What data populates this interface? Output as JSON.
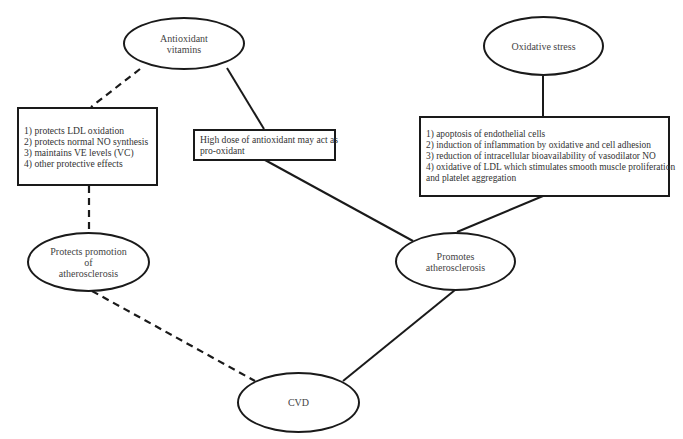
{
  "diagram": {
    "nodes": {
      "antioxidant_vitamins": {
        "lines": [
          "Antioxidant",
          "vitamins"
        ]
      },
      "oxidative_stress": {
        "lines": [
          "Oxidative stress"
        ]
      },
      "protective_effects_box": {
        "items": [
          "1) protects LDL oxidation",
          "2) protects normal NO synthesis",
          "3) maintains VE levels (VC)",
          "4) other protective effects"
        ]
      },
      "high_dose_box": {
        "lines": [
          "High dose of antioxidant may act as",
          "pro-oxidant"
        ]
      },
      "oxidative_effects_box": {
        "items": [
          "1) apoptosis of endothelial cells",
          "2) induction of inflammation by oxidative and cell adhesion",
          "3) reduction of intracellular bioavailability of vasodilator NO",
          "4) oxidative of LDL which stimulates smooth muscle proliferation",
          "and platelet aggregation"
        ]
      },
      "protects_promotion": {
        "lines": [
          "Protects promotion",
          "of",
          "atherosclerosis"
        ]
      },
      "promotes_atherosclerosis": {
        "lines": [
          "Promotes",
          "atherosclerosis"
        ]
      },
      "cvd": {
        "lines": [
          "CVD"
        ]
      }
    },
    "edges": [
      {
        "from": "antioxidant_vitamins",
        "to": "protective_effects_box",
        "style": "dashed"
      },
      {
        "from": "protective_effects_box",
        "to": "protects_promotion",
        "style": "dashed"
      },
      {
        "from": "protects_promotion",
        "to": "cvd",
        "style": "dashed"
      },
      {
        "from": "antioxidant_vitamins",
        "to": "high_dose_box",
        "style": "solid"
      },
      {
        "from": "high_dose_box",
        "to": "promotes_atherosclerosis",
        "style": "solid"
      },
      {
        "from": "oxidative_stress",
        "to": "oxidative_effects_box",
        "style": "solid"
      },
      {
        "from": "oxidative_effects_box",
        "to": "promotes_atherosclerosis",
        "style": "solid"
      },
      {
        "from": "promotes_atherosclerosis",
        "to": "cvd",
        "style": "solid"
      }
    ],
    "colors": {
      "stroke": "#1a1a1a",
      "text": "#333333",
      "background": "#ffffff"
    }
  }
}
